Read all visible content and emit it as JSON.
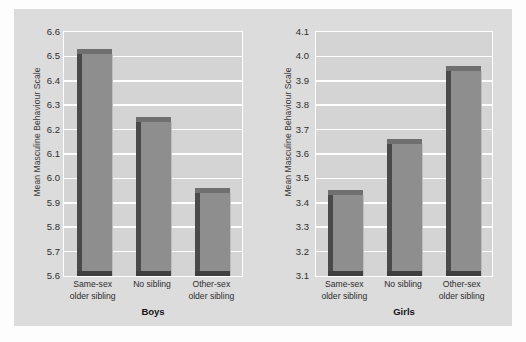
{
  "figure": {
    "panel_bg": "#dcdcdc",
    "plot_bg": "#d4d4d4",
    "bar_face_color": "#8e8e8e",
    "bar_side_color": "#4a4a4a",
    "gridline_color": "#ffffff"
  },
  "chart_data": [
    {
      "type": "bar",
      "title": "Boys",
      "xlabel": "Boys",
      "ylabel": "Mean Masculine Behaviour Scale",
      "categories": [
        "Same-sex older sibling",
        "No sibling",
        "Other-sex older sibling"
      ],
      "category_lines": [
        [
          "Same-sex",
          "older sibling"
        ],
        [
          "No sibling",
          ""
        ],
        [
          "Other-sex",
          "older sibling"
        ]
      ],
      "values": [
        6.51,
        6.23,
        5.94
      ],
      "ylim": [
        5.6,
        6.6
      ],
      "yticks": [
        "5.6",
        "5.7",
        "5.8",
        "5.9",
        "6.0",
        "6.1",
        "6.2",
        "6.3",
        "6.4",
        "6.5",
        "6.6"
      ],
      "ytick_values": [
        5.6,
        5.7,
        5.8,
        5.9,
        6.0,
        6.1,
        6.2,
        6.3,
        6.4,
        6.5,
        6.6
      ],
      "grid": true,
      "legend": "none"
    },
    {
      "type": "bar",
      "title": "Girls",
      "xlabel": "Girls",
      "ylabel": "Mean Masculine Behaviour Scale",
      "categories": [
        "Same-sex older sibling",
        "No sibling",
        "Other-sex older sibling"
      ],
      "category_lines": [
        [
          "Same-sex",
          "older sibling"
        ],
        [
          "No sibling",
          ""
        ],
        [
          "Other-sex",
          "older sibling"
        ]
      ],
      "values": [
        3.43,
        3.64,
        3.94
      ],
      "ylim": [
        3.1,
        4.1
      ],
      "yticks": [
        "3.1",
        "3.2",
        "3.3",
        "3.4",
        "3.5",
        "3.6",
        "3.7",
        "3.8",
        "3.9",
        "4.0",
        "4.1"
      ],
      "ytick_values": [
        3.1,
        3.2,
        3.3,
        3.4,
        3.5,
        3.6,
        3.7,
        3.8,
        3.9,
        4.0,
        4.1
      ],
      "grid": true,
      "legend": "none"
    }
  ]
}
